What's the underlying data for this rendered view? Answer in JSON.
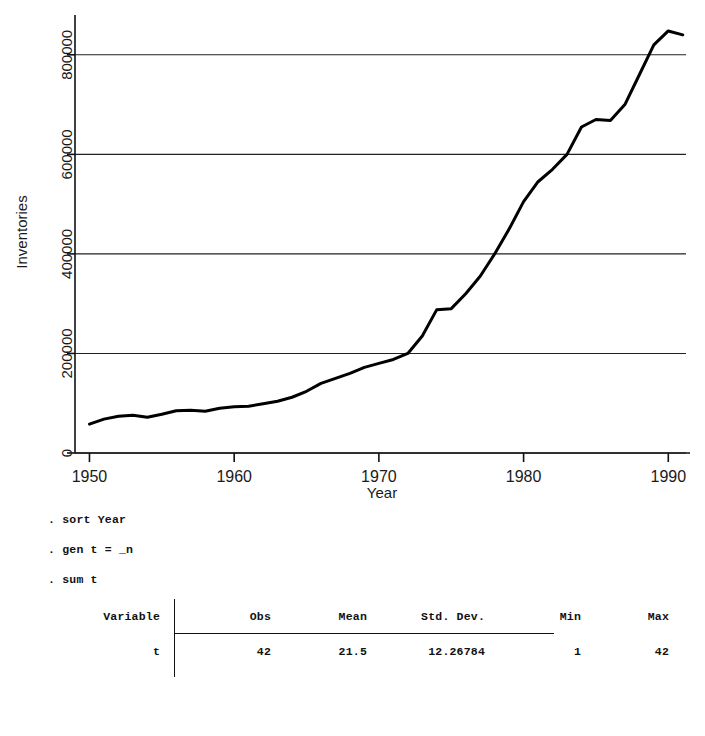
{
  "chart_data": {
    "type": "line",
    "title": "",
    "xlabel": "Year",
    "ylabel": "Inventories",
    "xlim": [
      1949,
      1991.5
    ],
    "ylim": [
      0,
      880000
    ],
    "xticks": [
      1950,
      1960,
      1970,
      1980,
      1990
    ],
    "xticklabels": [
      "1950",
      "1960",
      "1970",
      "1980",
      "1990"
    ],
    "yticks": [
      0,
      200000,
      400000,
      600000,
      800000
    ],
    "yticklabels": [
      "0",
      "200000",
      "400000",
      "600000",
      "800000"
    ],
    "grid": "horizontal",
    "legend": "none",
    "line_color": "#000000",
    "line_width": 3.0,
    "x": [
      1950,
      1951,
      1952,
      1953,
      1954,
      1955,
      1956,
      1957,
      1958,
      1959,
      1960,
      1961,
      1962,
      1963,
      1964,
      1965,
      1966,
      1967,
      1968,
      1969,
      1970,
      1971,
      1972,
      1973,
      1974,
      1975,
      1976,
      1977,
      1978,
      1979,
      1980,
      1981,
      1982,
      1983,
      1984,
      1985,
      1986,
      1987,
      1988,
      1989,
      1990,
      1991
    ],
    "values": [
      58000,
      68000,
      74000,
      76000,
      72000,
      78000,
      85000,
      86000,
      84000,
      90000,
      93000,
      94000,
      99000,
      104000,
      112000,
      124000,
      140000,
      150000,
      160000,
      172000,
      180000,
      188000,
      200000,
      235000,
      288000,
      290000,
      320000,
      355000,
      400000,
      450000,
      505000,
      545000,
      570000,
      600000,
      655000,
      670000,
      668000,
      700000,
      760000,
      820000,
      848000,
      840000
    ]
  },
  "console": {
    "commands": [
      ". sort Year",
      ". gen t = _n",
      ". sum t"
    ],
    "table": {
      "headers": [
        "Variable",
        "Obs",
        "Mean",
        "Std. Dev.",
        "Min",
        "Max"
      ],
      "rows": [
        {
          "variable": "t",
          "obs": "42",
          "mean": "21.5",
          "std_dev": "12.26784",
          "min": "1",
          "max": "42"
        }
      ]
    }
  }
}
